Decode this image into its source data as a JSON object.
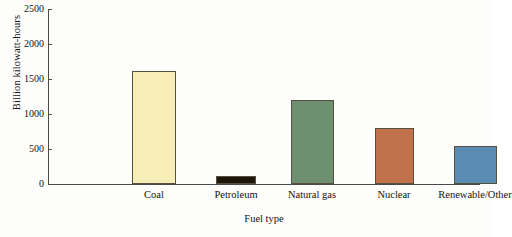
{
  "chart_data": {
    "type": "bar",
    "title": "",
    "xlabel": "Fuel type",
    "ylabel": "Billion kilowatt-hours",
    "categories": [
      "Coal",
      "Petroleum",
      "Natural gas",
      "Nuclear",
      "Renewable/Other"
    ],
    "values": [
      1610,
      115,
      1200,
      800,
      540
    ],
    "ylim": [
      0,
      2500
    ],
    "yticks": [
      0,
      500,
      1000,
      1500,
      2000,
      2500
    ],
    "ytick_labels": [
      "0",
      "500",
      "1000",
      "1500",
      "2000",
      "2500"
    ],
    "grid": false,
    "legend": "none",
    "bar_colors": [
      "#f6eeb6",
      "#1d1509",
      "#6f9070",
      "#c0734a",
      "#5a8cb2"
    ],
    "bar_edge_color": "#55503f"
  },
  "axis": {
    "ylabel": "Billion kilowatt-hours",
    "xlabel": "Fuel type"
  }
}
